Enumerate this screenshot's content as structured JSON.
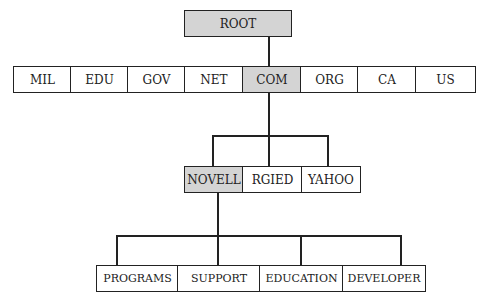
{
  "root": {
    "label": "ROOT",
    "highlighted": true
  },
  "level1": [
    {
      "label": "MIL"
    },
    {
      "label": "EDU"
    },
    {
      "label": "GOV"
    },
    {
      "label": "NET"
    },
    {
      "label": "COM",
      "highlighted": true
    },
    {
      "label": "ORG"
    },
    {
      "label": "CA"
    },
    {
      "label": "US"
    }
  ],
  "level2": [
    {
      "label": "NOVELL",
      "highlighted": true
    },
    {
      "label": "RGIED"
    },
    {
      "label": "YAHOO"
    }
  ],
  "level3": [
    {
      "label": "PROGRAMS"
    },
    {
      "label": "SUPPORT"
    },
    {
      "label": "EDUCATION"
    },
    {
      "label": "DEVELOPER"
    }
  ],
  "colors": {
    "highlight": "#d4d4d4",
    "line": "#222222"
  }
}
